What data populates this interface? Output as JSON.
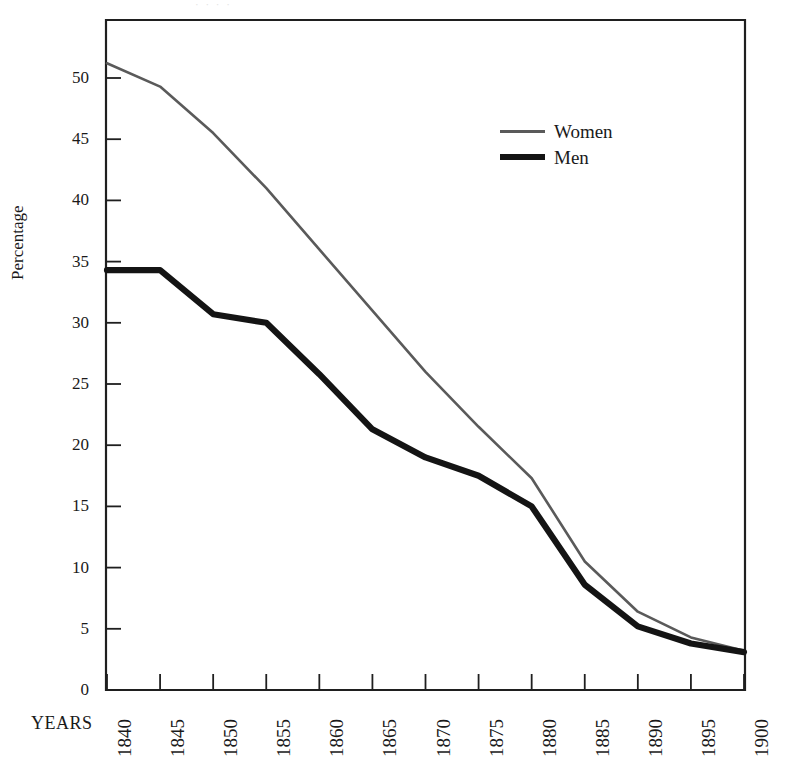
{
  "figure": {
    "top_remnant_text": "· · · ·",
    "axis_title_y": "Percentage",
    "axis_title_x": "YEARS"
  },
  "legend": {
    "position": "inside-top-right",
    "entries": [
      {
        "label": "Women",
        "color": "#5a5a5a",
        "style": "thin-line"
      },
      {
        "label": "Men",
        "color": "#141414",
        "style": "thick-line"
      }
    ]
  },
  "chart_data": {
    "type": "line",
    "title": "",
    "subtitle": "",
    "xlabel": "YEARS",
    "ylabel": "Percentage",
    "grid": false,
    "legend_position": "inside-top-right",
    "x": [
      1840,
      1845,
      1850,
      1855,
      1860,
      1865,
      1870,
      1875,
      1880,
      1885,
      1890,
      1895,
      1900
    ],
    "categories": [
      "1840",
      "1845",
      "1850",
      "1855",
      "1860",
      "1865",
      "1870",
      "1875",
      "1880",
      "1885",
      "1890",
      "1895",
      "1900"
    ],
    "xlim": [
      1840,
      1900
    ],
    "ylim": [
      0,
      52.5
    ],
    "ytick_labels": [
      "0",
      "5",
      "10",
      "15",
      "20",
      "25",
      "30",
      "35",
      "40",
      "45",
      "50"
    ],
    "yticks": [
      0,
      5,
      10,
      15,
      20,
      25,
      30,
      35,
      40,
      45,
      50
    ],
    "series": [
      {
        "name": "Women",
        "color": "#5a5a5a",
        "linewidth": 2.6,
        "values": [
          51.2,
          49.3,
          45.5,
          41.0,
          36.0,
          31.0,
          26.0,
          21.5,
          17.3,
          10.5,
          6.4,
          4.3,
          3.2
        ]
      },
      {
        "name": "Men",
        "color": "#141414",
        "linewidth": 6.2,
        "values": [
          34.3,
          34.3,
          30.7,
          30.0,
          25.8,
          21.3,
          19.0,
          17.5,
          15.0,
          8.6,
          5.2,
          3.8,
          3.1
        ]
      }
    ]
  }
}
